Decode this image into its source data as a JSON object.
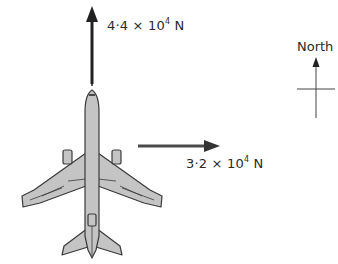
{
  "diagram": {
    "forces": [
      {
        "id": "north_force",
        "direction": "north",
        "mantissa": "4·4",
        "times": " × 10",
        "exponent": "4",
        "unit": " N"
      },
      {
        "id": "east_force",
        "direction": "east",
        "mantissa": "3·2",
        "times": " × 10",
        "exponent": "4",
        "unit": " N"
      }
    ],
    "compass": {
      "label": "North"
    },
    "aircraft": {
      "icon": "airplane-top-view",
      "heading": "north"
    },
    "colors": {
      "arrow": "#222222",
      "east_arrow": "#4a4a4a",
      "plane_fill": "#c4c4c4",
      "plane_outline": "#3a3a3a",
      "compass": "#444444"
    }
  }
}
